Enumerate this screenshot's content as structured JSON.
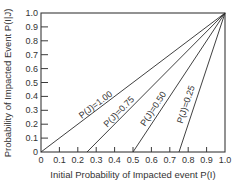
{
  "chart_data": {
    "type": "line",
    "title": "",
    "xlabel": "Initial Probability of Impacted event P(I)",
    "ylabel": "Probability of Impacted Event P(I|J)",
    "xlim": [
      0,
      1.0
    ],
    "ylim": [
      0,
      1.0
    ],
    "grid": false,
    "legend": "inline labels on lines",
    "x_ticks": [
      "0",
      "0.1",
      "0.2",
      "0.3",
      "0.4",
      "0.5",
      "0.6",
      "0.7",
      "0.8",
      "0.9",
      "1.0"
    ],
    "y_ticks": [
      "0",
      "0.1",
      "0.2",
      "0.3",
      "0.4",
      "0.5",
      "0.6",
      "0.7",
      "0.8",
      "0.9",
      "1.0"
    ],
    "series": [
      {
        "name": "P(J)=1.00",
        "x": [
          0.0,
          1.0
        ],
        "y": [
          0.0,
          1.0
        ]
      },
      {
        "name": "P(J)=0.75",
        "x": [
          0.25,
          1.0
        ],
        "y": [
          0.0,
          1.0
        ]
      },
      {
        "name": "P(J)=0.50",
        "x": [
          0.5,
          1.0
        ],
        "y": [
          0.0,
          1.0
        ]
      },
      {
        "name": "P(J)=0.25",
        "x": [
          0.75,
          1.0
        ],
        "y": [
          0.0,
          1.0
        ]
      }
    ]
  },
  "labels": {
    "xlabel": "Initial Probability of Impacted event P(I)",
    "ylabel": "Probability of Impacted Event P(I|J)"
  },
  "colors": {
    "line": "#2a2a2a",
    "axis": "#3a3a3a"
  }
}
